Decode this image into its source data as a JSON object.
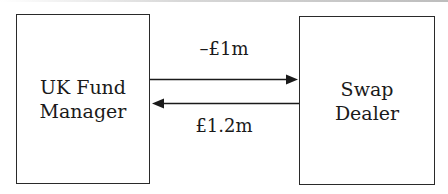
{
  "diagram": {
    "left_node": {
      "line1": "UK Fund",
      "line2": "Manager"
    },
    "right_node": {
      "line1": "Swap",
      "line2": "Dealer"
    },
    "flows": [
      {
        "label": "–£1m",
        "direction": "left-to-right"
      },
      {
        "label": "£1.2m",
        "direction": "right-to-left"
      }
    ],
    "colors": {
      "stroke": "#1a1a1a",
      "background": "#ffffff"
    }
  }
}
